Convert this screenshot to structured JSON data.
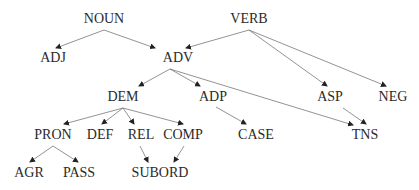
{
  "diagram": {
    "type": "directed-tree",
    "line_color": "#777777",
    "text_color": "#2a2a2a",
    "nodes": [
      {
        "id": "NOUN",
        "label": "NOUN",
        "x": 104,
        "y": 19
      },
      {
        "id": "VERB",
        "label": "VERB",
        "x": 249,
        "y": 19
      },
      {
        "id": "ADJ",
        "label": "ADJ",
        "x": 53,
        "y": 58
      },
      {
        "id": "ADV",
        "label": "ADV",
        "x": 178,
        "y": 58
      },
      {
        "id": "DEM",
        "label": "DEM",
        "x": 123,
        "y": 97
      },
      {
        "id": "ADP",
        "label": "ADP",
        "x": 213,
        "y": 97
      },
      {
        "id": "ASP",
        "label": "ASP",
        "x": 330,
        "y": 97
      },
      {
        "id": "NEG",
        "label": "NEG",
        "x": 393,
        "y": 97
      },
      {
        "id": "PRON",
        "label": "PRON",
        "x": 53,
        "y": 135
      },
      {
        "id": "DEF",
        "label": "DEF",
        "x": 100,
        "y": 135
      },
      {
        "id": "REL",
        "label": "REL",
        "x": 141,
        "y": 135
      },
      {
        "id": "COMP",
        "label": "COMP",
        "x": 183,
        "y": 135
      },
      {
        "id": "CASE",
        "label": "CASE",
        "x": 256,
        "y": 135
      },
      {
        "id": "TNS",
        "label": "TNS",
        "x": 365,
        "y": 135
      },
      {
        "id": "AGR",
        "label": "AGR",
        "x": 29,
        "y": 173
      },
      {
        "id": "PASS",
        "label": "PASS",
        "x": 79,
        "y": 173
      },
      {
        "id": "SUBORD",
        "label": "SUBORD",
        "x": 160,
        "y": 173
      }
    ],
    "edges": [
      {
        "from": "NOUN",
        "to": "ADJ",
        "x1": 104,
        "y1": 30,
        "x2": 56,
        "y2": 48
      },
      {
        "from": "NOUN",
        "to": "ADV",
        "x1": 104,
        "y1": 30,
        "x2": 155,
        "y2": 48
      },
      {
        "from": "VERB",
        "to": "ADV",
        "x1": 249,
        "y1": 30,
        "x2": 186,
        "y2": 48
      },
      {
        "from": "VERB",
        "to": "ASP",
        "x1": 249,
        "y1": 30,
        "x2": 327,
        "y2": 86
      },
      {
        "from": "VERB",
        "to": "NEG",
        "x1": 249,
        "y1": 30,
        "x2": 386,
        "y2": 86
      },
      {
        "from": "ADV",
        "to": "DEM",
        "x1": 170,
        "y1": 69,
        "x2": 139,
        "y2": 86
      },
      {
        "from": "ADV",
        "to": "ADP",
        "x1": 170,
        "y1": 69,
        "x2": 200,
        "y2": 86
      },
      {
        "from": "ADV",
        "to": "TNS",
        "x1": 170,
        "y1": 69,
        "x2": 353,
        "y2": 125
      },
      {
        "from": "DEM",
        "to": "PRON",
        "x1": 123,
        "y1": 108,
        "x2": 64,
        "y2": 124
      },
      {
        "from": "DEM",
        "to": "DEF",
        "x1": 123,
        "y1": 108,
        "x2": 102,
        "y2": 124
      },
      {
        "from": "DEM",
        "to": "REL",
        "x1": 123,
        "y1": 108,
        "x2": 134,
        "y2": 124
      },
      {
        "from": "DEM",
        "to": "COMP",
        "x1": 123,
        "y1": 108,
        "x2": 183,
        "y2": 124
      },
      {
        "from": "ADP",
        "to": "CASE",
        "x1": 216,
        "y1": 107,
        "x2": 246,
        "y2": 124
      },
      {
        "from": "ASP",
        "to": "TNS",
        "x1": 343,
        "y1": 108,
        "x2": 366,
        "y2": 124
      },
      {
        "from": "PRON",
        "to": "AGR",
        "x1": 53,
        "y1": 146,
        "x2": 30,
        "y2": 162
      },
      {
        "from": "PRON",
        "to": "PASS",
        "x1": 53,
        "y1": 146,
        "x2": 78,
        "y2": 162
      },
      {
        "from": "REL",
        "to": "SUBORD",
        "x1": 140,
        "y1": 146,
        "x2": 148,
        "y2": 162
      },
      {
        "from": "COMP",
        "to": "SUBORD",
        "x1": 184,
        "y1": 146,
        "x2": 174,
        "y2": 162
      }
    ]
  }
}
